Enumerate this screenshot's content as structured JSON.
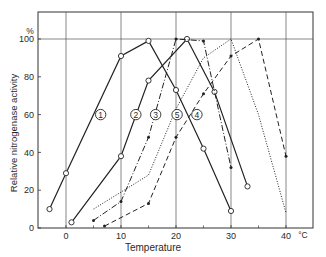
{
  "chart_data": {
    "type": "line",
    "title": "",
    "xlabel": "Temperature",
    "xunit": "°C",
    "ylabel": "Relative nitrogenase activity",
    "yunit": "%",
    "xlim": [
      -5,
      45
    ],
    "ylim": [
      0,
      114
    ],
    "xticks": [
      0,
      10,
      20,
      30,
      40
    ],
    "yticks": [
      0,
      20,
      40,
      60,
      80,
      100
    ],
    "grid": {
      "vertical": [
        0,
        10,
        20,
        30,
        40
      ],
      "horizontal": [
        100
      ]
    },
    "legend": "circled numbers placed on curves",
    "series": [
      {
        "name": "1",
        "style": "solid",
        "marker": "open-circle",
        "label_pos": [
          6.3,
          60
        ],
        "x": [
          -3,
          0,
          10,
          15,
          20,
          25,
          30
        ],
        "y": [
          10,
          29,
          91,
          99,
          73,
          42,
          9
        ]
      },
      {
        "name": "2",
        "style": "solid",
        "marker": "open-circle",
        "label_pos": [
          12.7,
          60
        ],
        "x": [
          1,
          10,
          15,
          22,
          27,
          33
        ],
        "y": [
          3,
          38,
          78,
          100,
          72,
          22
        ]
      },
      {
        "name": "3",
        "style": "dash-dot",
        "marker": "filled-dot",
        "label_pos": [
          16.3,
          60
        ],
        "x": [
          5,
          10,
          15,
          20,
          25,
          30
        ],
        "y": [
          4,
          14,
          48,
          100,
          99,
          32
        ]
      },
      {
        "name": "4",
        "style": "dashed",
        "marker": "filled-dot",
        "label_pos": [
          23.8,
          60
        ],
        "x": [
          7,
          15,
          20,
          25,
          30,
          35,
          40
        ],
        "y": [
          1,
          13,
          48,
          71,
          91,
          100,
          38
        ]
      },
      {
        "name": "5",
        "style": "dotted",
        "marker": "none",
        "label_pos": [
          20.2,
          60
        ],
        "x": [
          5,
          15,
          20,
          25,
          30,
          35,
          40
        ],
        "y": [
          10,
          28,
          63,
          90,
          100,
          60,
          8
        ]
      }
    ]
  }
}
